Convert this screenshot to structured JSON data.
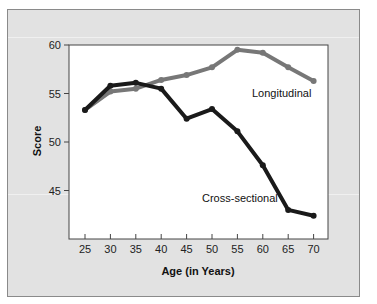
{
  "chart_data": {
    "type": "line",
    "title": "",
    "xlabel": "Age (in Years)",
    "ylabel": "Score",
    "x": [
      25,
      30,
      35,
      40,
      45,
      50,
      55,
      60,
      65,
      70
    ],
    "xticks": [
      "25",
      "30",
      "35",
      "40",
      "45",
      "50",
      "55",
      "60",
      "65",
      "70"
    ],
    "yticks": [
      "45",
      "50",
      "55",
      "60"
    ],
    "ylim": [
      40,
      60
    ],
    "grid": false,
    "legend_position": "inline labels",
    "series": [
      {
        "name": "Longitudinal",
        "color": "#777777",
        "values": [
          53.3,
          55.2,
          55.5,
          56.4,
          56.9,
          57.7,
          59.5,
          59.2,
          57.7,
          56.3
        ]
      },
      {
        "name": "Cross-sectional",
        "color": "#1a1a1a",
        "values": [
          53.3,
          55.8,
          56.1,
          55.5,
          52.4,
          53.4,
          51.1,
          47.6,
          43.0,
          42.4
        ]
      }
    ]
  },
  "labels": {
    "xlabel": "Age (in Years)",
    "ylabel": "Score",
    "longitudinal": "Longitudinal",
    "cross_sectional": "Cross-sectional"
  }
}
